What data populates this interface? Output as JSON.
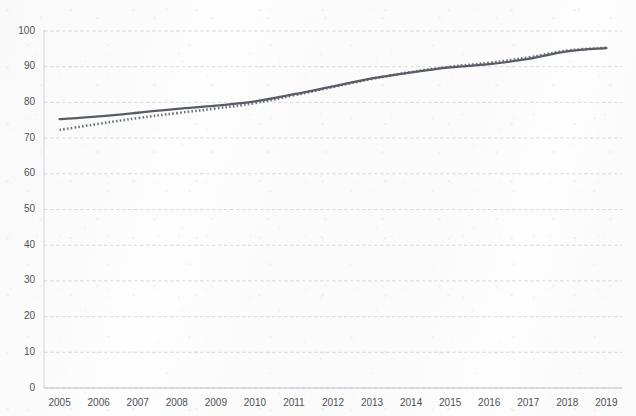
{
  "chart_data": {
    "type": "line",
    "title": "",
    "subtitle": "",
    "xlabel": "",
    "ylabel": "",
    "categories": [
      "2005",
      "2006",
      "2007",
      "2008",
      "2009",
      "2010",
      "2011",
      "2012",
      "2013",
      "2014",
      "2015",
      "2016",
      "2017",
      "2018",
      "2019"
    ],
    "x": [
      2005,
      2006,
      2007,
      2008,
      2009,
      2010,
      2011,
      2012,
      2013,
      2014,
      2015,
      2016,
      2017,
      2018,
      2019
    ],
    "xlim": [
      2004.6,
      2019.4
    ],
    "ylim": [
      0,
      100
    ],
    "ytick_labels": [
      "0",
      "10",
      "20",
      "30",
      "40",
      "50",
      "60",
      "70",
      "80",
      "90",
      "100"
    ],
    "ytick_values": [
      0,
      10,
      20,
      30,
      40,
      50,
      60,
      70,
      80,
      90,
      100
    ],
    "grid": true,
    "grid_axis": "y",
    "grid_style": "dashed",
    "grid_color": "#c9ccd2",
    "legend": false,
    "legend_position": "none",
    "annotations": [],
    "series": [
      {
        "name": "Series 1",
        "style": "solid",
        "color": "#4a4f56",
        "values": [
          75.3,
          76.1,
          77.1,
          78.2,
          79.1,
          80.3,
          82.3,
          84.5,
          86.7,
          88.4,
          89.8,
          90.7,
          92.2,
          94.3,
          95.2
        ]
      },
      {
        "name": "Series 2",
        "style": "dotted",
        "color": "#5b6069",
        "values": [
          72.3,
          74.0,
          75.6,
          77.0,
          78.3,
          79.8,
          82.0,
          84.3,
          86.6,
          88.5,
          90.0,
          91.1,
          92.6,
          94.5,
          95.3
        ]
      }
    ]
  },
  "axes": {
    "y_axis_name": "value-axis",
    "x_axis_name": "year-axis"
  }
}
